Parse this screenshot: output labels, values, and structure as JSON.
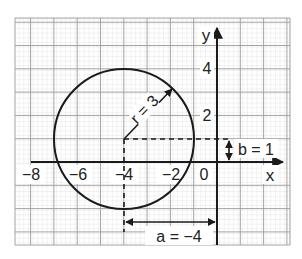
{
  "figure": {
    "axes": {
      "x_label": "x",
      "y_label": "y",
      "x_ticks": [
        {
          "value": -8,
          "label": "−8"
        },
        {
          "value": -6,
          "label": "−6"
        },
        {
          "value": -4,
          "label": "−4"
        },
        {
          "value": -2,
          "label": "−2"
        },
        {
          "value": 0,
          "label": "0"
        }
      ],
      "y_ticks": [
        {
          "value": 2,
          "label": "2"
        },
        {
          "value": 4,
          "label": "4"
        }
      ]
    },
    "circle": {
      "center_x": -4,
      "center_y": 1,
      "radius": 3
    },
    "annotations": {
      "radius_label": "r = 3",
      "a_label": "a = −4",
      "b_label": "b = 1"
    },
    "colors": {
      "ink": "#1a1a1a",
      "grid_minor": "#d4d4d4",
      "grid_major": "#9a9a9a",
      "paper": "#ffffff"
    }
  }
}
